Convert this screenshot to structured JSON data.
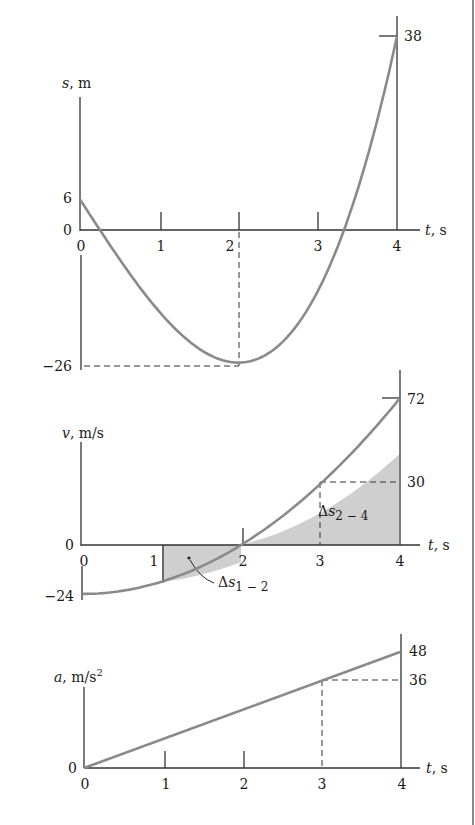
{
  "chart_data": [
    {
      "type": "line",
      "title": "",
      "xlabel": "t, s",
      "ylabel": "s, m",
      "x": [
        0,
        0.5,
        1,
        1.5,
        2,
        2.5,
        3,
        3.5,
        4
      ],
      "series": [
        {
          "name": "s(t)",
          "values": [
            6,
            -5.75,
            -16,
            -23.25,
            -26,
            -22.75,
            -12,
            7.75,
            38
          ]
        }
      ],
      "x_ticks": [
        "0",
        "1",
        "2",
        "3",
        "4"
      ],
      "y_ticks": [
        "38",
        "6",
        "0",
        "−26"
      ],
      "annotations": [
        "dashed guide at t = 2 to s = −26",
        "marker at t = 4, s = 38"
      ],
      "xlim": [
        0,
        4
      ],
      "ylim": [
        -26,
        38
      ],
      "grid": false
    },
    {
      "type": "area",
      "title": "",
      "xlabel": "t, s",
      "ylabel": "v, m/s",
      "x": [
        0,
        0.5,
        1,
        1.5,
        2,
        2.5,
        3,
        3.5,
        4
      ],
      "series": [
        {
          "name": "v(t)",
          "values": [
            -24,
            -22.5,
            -18,
            -10.5,
            0,
            13.5,
            30,
            49.5,
            72
          ]
        }
      ],
      "x_ticks": [
        "0",
        "1",
        "2",
        "3",
        "4"
      ],
      "y_ticks": [
        "72",
        "30",
        "0",
        "−24"
      ],
      "shaded_regions": [
        {
          "label": "Δs1−2",
          "from_t": 1,
          "to_t": 2
        },
        {
          "label": "Δs2−4",
          "from_t": 2,
          "to_t": 4
        }
      ],
      "annotations": [
        "dashed guide at t = 3 to v = 30"
      ],
      "xlim": [
        0,
        4
      ],
      "ylim": [
        -24,
        72
      ],
      "grid": false
    },
    {
      "type": "line",
      "title": "",
      "xlabel": "t, s",
      "ylabel": "a, m/s²",
      "x": [
        0,
        1,
        2,
        3,
        4
      ],
      "series": [
        {
          "name": "a(t)",
          "values": [
            0,
            12,
            24,
            36,
            48
          ]
        }
      ],
      "x_ticks": [
        "0",
        "1",
        "2",
        "3",
        "4"
      ],
      "y_ticks": [
        "48",
        "36",
        "0"
      ],
      "annotations": [
        "dashed guide at t = 3 to a = 36"
      ],
      "xlim": [
        0,
        4
      ],
      "ylim": [
        0,
        48
      ],
      "grid": false
    }
  ],
  "s_plot": {
    "y_label_var": "s",
    "y_label_unit": ", m",
    "x_label_var": "t",
    "x_label_unit": ", s",
    "y_ticks": {
      "top": "38",
      "six": "6",
      "zero": "0",
      "min": "−26"
    },
    "x_ticks": [
      "0",
      "1",
      "2",
      "3",
      "4"
    ]
  },
  "v_plot": {
    "y_label_var": "v",
    "y_label_unit": ", m/s",
    "x_label_var": "t",
    "x_label_unit": ", s",
    "y_ticks": {
      "top": "72",
      "mid": "30",
      "zero": "0",
      "min": "−24"
    },
    "x_ticks": [
      "0",
      "1",
      "2",
      "3",
      "4"
    ],
    "region_1_2": {
      "delta": "Δ",
      "var": "s",
      "sub": "1 − 2"
    },
    "region_2_4": {
      "delta": "Δ",
      "var": "s",
      "sub": "2 − 4"
    }
  },
  "a_plot": {
    "y_label_var": "a",
    "y_label_unit": ", m/s",
    "y_label_exp": "2",
    "x_label_var": "t",
    "x_label_unit": ", s",
    "y_ticks": {
      "top": "48",
      "mid": "36",
      "zero": "0"
    },
    "x_ticks": [
      "0",
      "1",
      "2",
      "3",
      "4"
    ]
  }
}
